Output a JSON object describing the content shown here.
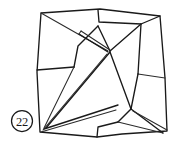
{
  "figure": {
    "label": "origami-crease-pattern",
    "step_badge": {
      "text": "22",
      "shape": "circle",
      "cx": 22,
      "cy": 121,
      "r": 10.5
    },
    "colors": {
      "stroke": "#1a1a1a",
      "stroke_light": "#2b2b2b",
      "fill": "#ffffff",
      "background": "#ffffff"
    },
    "outline": {
      "name": "outer-square-boundary",
      "points": "41,13 100,9 160,16 165,78 167,130 120,134 96,137 41,132 37,70"
    },
    "paths": [
      {
        "name": "outer-boundary",
        "d": "M41,13 L100,9 L160,16 L165,78 L167,131 L122,134 L97,137 L40,132 L37,72 Z",
        "weight": "thick"
      },
      {
        "name": "top-edge-inner-left",
        "d": "M41,13 L98,10",
        "weight": "thick"
      },
      {
        "name": "top-notch-right",
        "d": "M98,10 L99,22 L141,24",
        "weight": "thick"
      },
      {
        "name": "top-right-diagonal",
        "d": "M160,16 L141,24 L110,51",
        "weight": "thick"
      },
      {
        "name": "left-upper-diagonal",
        "d": "M41,13 L108,51",
        "weight": "thin"
      },
      {
        "name": "left-mid-horizontal",
        "d": "M37,70 L74,67",
        "weight": "thick"
      },
      {
        "name": "left-panel-right-edge",
        "d": "M74,67 L78,46 L98,26",
        "weight": "thick"
      },
      {
        "name": "center-upper-crease",
        "d": "M98,26 L110,51",
        "weight": "thick"
      },
      {
        "name": "long-spine-upper",
        "d": "M79,34 L108,52",
        "weight": "thick"
      },
      {
        "name": "long-spine-sliver",
        "d": "M81,31 L110,50",
        "weight": "thin"
      },
      {
        "name": "center-to-lower-left-spine-a",
        "d": "M110,52 L46,128",
        "weight": "thick"
      },
      {
        "name": "center-to-lower-left-spine-b",
        "d": "M107,54 L44,130",
        "weight": "thin"
      },
      {
        "name": "center-to-lower-right",
        "d": "M110,52 L131,109",
        "weight": "thick"
      },
      {
        "name": "lower-left-wedge-top",
        "d": "M44,130 L118,105",
        "weight": "thick"
      },
      {
        "name": "lower-left-wedge-bottom",
        "d": "M41,132 L115,110",
        "weight": "thin"
      },
      {
        "name": "bottom-center-notch",
        "d": "M97,137 L98,127 L118,122",
        "weight": "thick"
      },
      {
        "name": "lower-right-fan-a",
        "d": "M131,109 L164,133",
        "weight": "thick"
      },
      {
        "name": "lower-right-fan-b",
        "d": "M133,111 L167,131",
        "weight": "thin"
      },
      {
        "name": "right-panel-left-edge",
        "d": "M131,109 L138,74 L165,72",
        "weight": "thick"
      },
      {
        "name": "right-mid-horizontal",
        "d": "M138,74 L165,78",
        "weight": "thin"
      },
      {
        "name": "right-upper-panel-edge",
        "d": "M141,24 L138,74",
        "weight": "thick"
      },
      {
        "name": "lower-left-panel-edge",
        "d": "M74,67 L44,128",
        "weight": "thin"
      },
      {
        "name": "bottom-right-panel-edge",
        "d": "M118,122 L131,109",
        "weight": "thick"
      },
      {
        "name": "bottom-edge-right",
        "d": "M118,122 L164,133",
        "weight": "thin"
      }
    ]
  }
}
